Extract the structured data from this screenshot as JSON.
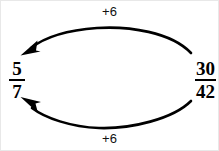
{
  "diagram": {
    "type": "fraction-simplification",
    "background_color": "#ffffff",
    "stroke_color": "#000000",
    "left_fraction": {
      "numerator": "5",
      "denominator": "7",
      "value": "5/7"
    },
    "right_fraction": {
      "numerator": "30",
      "denominator": "42",
      "value": "30/42"
    },
    "top_arrow": {
      "label": "+6",
      "direction": "right-to-left",
      "arrowhead": "left-end"
    },
    "bottom_arrow": {
      "label": "+6",
      "direction": "right-to-left",
      "arrowhead": "left-end"
    }
  }
}
